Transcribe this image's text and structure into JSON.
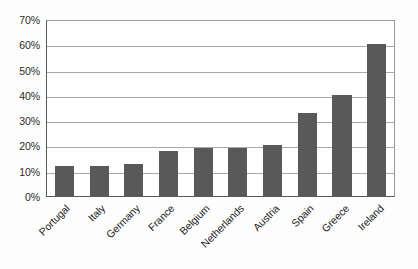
{
  "chart_data": {
    "type": "bar",
    "title": "",
    "subtitle": "",
    "xlabel": "",
    "ylabel": "",
    "ylim": [
      0,
      70
    ],
    "y_tick_labels": [
      "0%",
      "10%",
      "20%",
      "30%",
      "40%",
      "50%",
      "60%",
      "70%"
    ],
    "y_tick_values": [
      0,
      10,
      20,
      30,
      40,
      50,
      60,
      70
    ],
    "grid": true,
    "legend": "none",
    "categories": [
      "Portugal",
      "Italy",
      "Germany",
      "France",
      "Belgium",
      "Netherlands",
      "Austria",
      "Spain",
      "Greece",
      "Ireland"
    ],
    "values": [
      12,
      12,
      12.5,
      18,
      19,
      19,
      20,
      33,
      40,
      60
    ],
    "value_unit": "%",
    "bar_color": "#595959",
    "gridline_color": "#a8a8a8",
    "axis_color": "#5a5a5a",
    "plot_background": "#ffffff"
  }
}
